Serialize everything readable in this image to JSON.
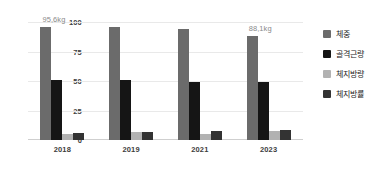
{
  "chart_data": {
    "type": "bar",
    "title": "",
    "subtitle": "",
    "xlabel": "",
    "ylabel": "",
    "categories": [
      "2018",
      "2019",
      "2021",
      "2023"
    ],
    "series": [
      {
        "name": "체중",
        "color": "#6b6b6b",
        "values": [
          95.6,
          96.0,
          94.5,
          88.1
        ]
      },
      {
        "name": "골격근량",
        "color": "#151515",
        "values": [
          51.0,
          51.0,
          49.5,
          49.5
        ]
      },
      {
        "name": "체지방량",
        "color": "#b2b2b2",
        "values": [
          5.0,
          6.5,
          5.5,
          7.5
        ]
      },
      {
        "name": "체지방률",
        "color": "#333333",
        "values": [
          6.0,
          7.0,
          8.0,
          8.5
        ]
      }
    ],
    "ylim": [
      0,
      100
    ],
    "yticks": [
      100,
      75,
      50,
      25,
      0
    ],
    "grid": true,
    "legend_position": "right",
    "annotations": [
      {
        "text": "95,6kg",
        "category": "2018",
        "series": "체중"
      },
      {
        "text": "88,1kg",
        "category": "2023",
        "series": "체중"
      }
    ]
  },
  "axes": {
    "y_tick_labels": [
      "100",
      "75",
      "50",
      "25",
      "0"
    ],
    "x_tick_labels": [
      "2018",
      "2019",
      "2021",
      "2023"
    ]
  },
  "legend": {
    "items": [
      {
        "label": "체중",
        "swatch_color": "#6b6b6b",
        "icon": "legend-swatch-icon"
      },
      {
        "label": "골격근량",
        "swatch_color": "#151515",
        "icon": "legend-swatch-icon"
      },
      {
        "label": "체지방량",
        "swatch_color": "#b2b2b2",
        "icon": "legend-swatch-icon"
      },
      {
        "label": "체지방률",
        "swatch_color": "#333333",
        "icon": "legend-swatch-icon"
      }
    ]
  },
  "annotations": {
    "first": "95,6kg",
    "last": "88,1kg"
  }
}
